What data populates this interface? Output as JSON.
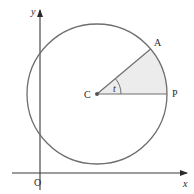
{
  "diagram": {
    "type": "unit-circle-sector",
    "colors": {
      "stroke": "#6e6e6e",
      "axis": "#3a3a3a",
      "sector_fill": "#ececec",
      "text": "#2a2a2a"
    },
    "labels": {
      "y_axis": "y",
      "x_axis": "x",
      "origin": "O",
      "center": "C",
      "point_a": "A",
      "point_p": "P",
      "angle": "t"
    },
    "geometry": {
      "center": [
        97,
        94
      ],
      "radius": 70,
      "angle_deg": 40
    }
  }
}
